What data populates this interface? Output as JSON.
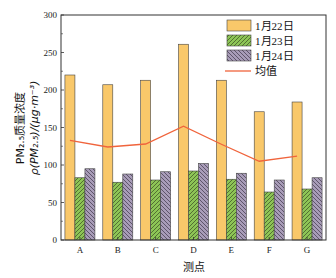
{
  "chart_data": {
    "type": "bar",
    "title": "",
    "xlabel": "测点",
    "ylabel": "PM2.5质量浓度 ρ(PM2.5)/(μg·m⁻³)",
    "ylabel_line1": "PM₂.₅质量浓度",
    "ylabel_line2": "ρ(PM₂.₅)/(μg·m⁻³)",
    "categories": [
      "A",
      "B",
      "C",
      "D",
      "E",
      "F",
      "G"
    ],
    "ylim": [
      0,
      300
    ],
    "yticks": [
      0,
      50,
      100,
      150,
      200,
      250,
      300
    ],
    "grid": false,
    "legend_position": "upper right",
    "series": [
      {
        "name": "1月22日",
        "type": "bar",
        "color": "#F9C86A",
        "pattern": "none",
        "values": [
          220,
          207,
          213,
          261,
          213,
          171,
          184
        ]
      },
      {
        "name": "1月23日",
        "type": "bar",
        "color": "#8DC556",
        "pattern": "hatch-forward",
        "values": [
          83,
          77,
          80,
          92,
          81,
          64,
          68
        ]
      },
      {
        "name": "1月24日",
        "type": "bar",
        "color": "#A89CB8",
        "pattern": "hatch-backward",
        "values": [
          95,
          88,
          91,
          102,
          89,
          80,
          83
        ]
      },
      {
        "name": "均值",
        "type": "line",
        "color": "#F0643C",
        "values": [
          132.7,
          124.0,
          128.0,
          151.7,
          127.7,
          105.0,
          111.7
        ]
      }
    ]
  }
}
